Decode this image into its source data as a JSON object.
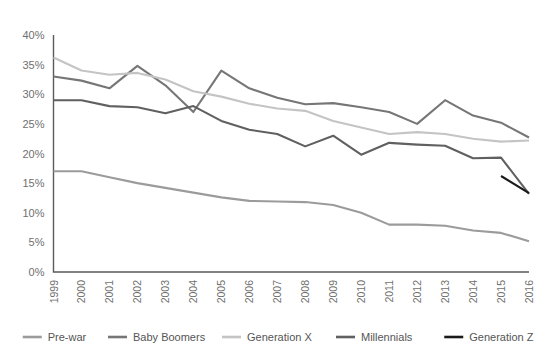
{
  "chart_data": {
    "type": "line",
    "title": "",
    "xlabel": "",
    "ylabel": "",
    "ylim": [
      0,
      40
    ],
    "ytick_labels": [
      "0%",
      "5%",
      "10%",
      "15%",
      "20%",
      "25%",
      "30%",
      "35%",
      "40%"
    ],
    "ytick_values": [
      0,
      5,
      10,
      15,
      20,
      25,
      30,
      35,
      40
    ],
    "grid": false,
    "legend_position": "bottom",
    "categories": [
      "1999",
      "2000",
      "2001",
      "2002",
      "2003",
      "2004",
      "2005",
      "2006",
      "2007",
      "2008",
      "2009",
      "2010",
      "2011",
      "2012",
      "2013",
      "2014",
      "2015",
      "2016"
    ],
    "series": [
      {
        "name": "Pre-war",
        "color": "#9b9b9b",
        "values": [
          17.0,
          17.0,
          16.0,
          15.0,
          14.2,
          13.4,
          12.6,
          12.0,
          11.9,
          11.8,
          11.3,
          10.0,
          8.0,
          8.0,
          7.8,
          7.0,
          6.6,
          5.2
        ]
      },
      {
        "name": "Baby Boomers",
        "color": "#767676",
        "values": [
          33.0,
          32.3,
          31.0,
          34.8,
          31.5,
          27.0,
          34.0,
          31.0,
          29.4,
          28.3,
          28.5,
          27.8,
          27.0,
          25.0,
          29.0,
          26.4,
          25.2,
          22.7
        ]
      },
      {
        "name": "Generation X",
        "color": "#c4c4c4",
        "values": [
          36.2,
          34.0,
          33.3,
          33.6,
          32.5,
          30.5,
          29.6,
          28.4,
          27.6,
          27.2,
          25.5,
          24.4,
          23.3,
          23.6,
          23.3,
          22.5,
          22.0,
          22.2
        ]
      },
      {
        "name": "Millennials",
        "color": "#606060",
        "values": [
          29.0,
          29.0,
          28.0,
          27.8,
          26.8,
          28.0,
          25.5,
          24.0,
          23.3,
          21.2,
          23.0,
          19.8,
          21.8,
          21.5,
          21.3,
          19.2,
          19.3,
          13.2
        ]
      },
      {
        "name": "Generation Z",
        "color": "#1a1a1a",
        "values": [
          null,
          null,
          null,
          null,
          null,
          null,
          null,
          null,
          null,
          null,
          null,
          null,
          null,
          null,
          null,
          null,
          16.2,
          13.3
        ]
      }
    ]
  },
  "legend": {
    "items": [
      {
        "label": "Pre-war"
      },
      {
        "label": "Baby Boomers"
      },
      {
        "label": "Generation X"
      },
      {
        "label": "Millennials"
      },
      {
        "label": "Generation Z"
      }
    ]
  }
}
